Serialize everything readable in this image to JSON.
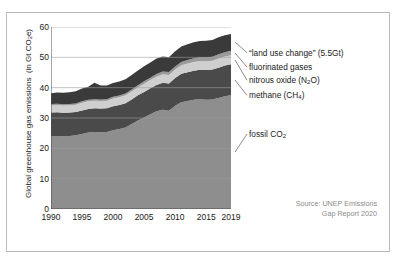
{
  "chart_data": {
    "type": "area",
    "title": "",
    "xlabel": "",
    "ylabel": "Global greenhouse gas emissions  (in Gt CO₂e)",
    "xlim": [
      1990,
      2019
    ],
    "ylim": [
      0,
      60
    ],
    "grid": true,
    "stacked": true,
    "legend_position": "right-outside",
    "yticks": [
      "0",
      "10",
      "20",
      "30",
      "40",
      "50",
      "60"
    ],
    "xticks": [
      "1990",
      "1995",
      "2000",
      "2005",
      "2010",
      "2015",
      "2019"
    ],
    "x": [
      1990,
      1991,
      1992,
      1993,
      1994,
      1995,
      1996,
      1997,
      1998,
      1999,
      2000,
      2001,
      2002,
      2003,
      2004,
      2005,
      2006,
      2007,
      2008,
      2009,
      2010,
      2011,
      2012,
      2013,
      2014,
      2015,
      2016,
      2017,
      2018,
      2019
    ],
    "series": [
      {
        "name": "fossil CO₂",
        "color": "#8e8e8e",
        "values": [
          24.0,
          24.1,
          24.0,
          24.1,
          24.3,
          24.7,
          25.2,
          25.4,
          25.3,
          25.4,
          26.0,
          26.4,
          26.9,
          28.0,
          29.2,
          30.2,
          31.2,
          32.2,
          32.7,
          32.4,
          34.0,
          35.2,
          35.6,
          36.0,
          36.2,
          36.0,
          36.1,
          36.6,
          37.2,
          37.5
        ]
      },
      {
        "name": "methane (CH₄)",
        "color": "#4a4a4a",
        "values": [
          7.8,
          7.8,
          7.7,
          7.7,
          7.7,
          7.8,
          7.8,
          7.8,
          7.8,
          7.8,
          7.9,
          7.9,
          8.0,
          8.1,
          8.3,
          8.4,
          8.6,
          8.7,
          8.9,
          9.0,
          9.2,
          9.4,
          9.5,
          9.6,
          9.7,
          9.8,
          9.9,
          10.0,
          10.1,
          10.2
        ]
      },
      {
        "name": "nitrous oxide (N₂O)",
        "color": "#cfcfcf",
        "values": [
          2.4,
          2.4,
          2.4,
          2.4,
          2.4,
          2.5,
          2.5,
          2.5,
          2.5,
          2.5,
          2.5,
          2.5,
          2.6,
          2.6,
          2.6,
          2.7,
          2.7,
          2.7,
          2.8,
          2.8,
          2.8,
          2.8,
          2.9,
          2.9,
          2.9,
          2.9,
          2.9,
          3.0,
          3.0,
          3.0
        ]
      },
      {
        "name": "fluorinated gases",
        "color": "#9a9a9a",
        "values": [
          0.4,
          0.4,
          0.4,
          0.4,
          0.4,
          0.5,
          0.5,
          0.5,
          0.5,
          0.5,
          0.6,
          0.6,
          0.6,
          0.7,
          0.7,
          0.8,
          0.8,
          0.9,
          0.9,
          1.0,
          1.0,
          1.1,
          1.1,
          1.2,
          1.2,
          1.3,
          1.3,
          1.4,
          1.4,
          1.5
        ]
      },
      {
        "name": "“land use change” (5.5Gt)",
        "color": "#3a3a3a",
        "values": [
          3.6,
          3.7,
          3.8,
          3.9,
          4.0,
          4.2,
          4.3,
          5.4,
          4.6,
          4.5,
          4.5,
          4.6,
          4.7,
          4.8,
          4.9,
          5.0,
          5.0,
          5.1,
          5.0,
          4.8,
          5.0,
          5.1,
          5.2,
          5.3,
          5.4,
          5.5,
          5.5,
          5.6,
          5.6,
          5.5
        ]
      }
    ],
    "totals_note": "2019 total approximately 59 Gt CO2e"
  },
  "legend": {
    "items": [
      {
        "label": "“land use change” (5.5Gt)"
      },
      {
        "label": "fluorinated gases"
      },
      {
        "label": "nitrous oxide (N₂O)"
      },
      {
        "label": "methane (CH₄)"
      },
      {
        "label": "fossil CO₂"
      }
    ]
  },
  "source": {
    "line1": "Source: UNEP Emissions",
    "line2": "Gap Report 2020"
  },
  "colors": {
    "border": "#b9b9b9",
    "grid": "#9d9d9d",
    "axis": "#4d4d4d",
    "text": "#1a1a1a",
    "source_text": "#8a8a8a"
  }
}
